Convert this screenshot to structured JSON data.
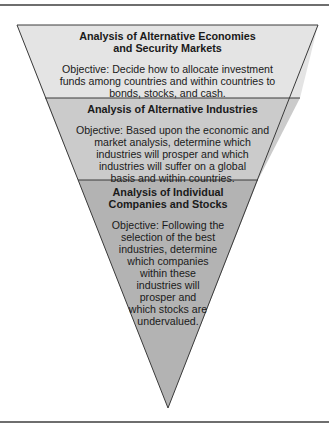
{
  "diagram": {
    "type": "inverted-funnel",
    "colors": {
      "level1_fill": "#e4e4e4",
      "level2_fill": "#cbcbcb",
      "level3_fill": "#b3b3b3",
      "outline": "#3a3a3a",
      "rule": "#6e6e6e"
    },
    "levels": [
      {
        "title_line1": "Analysis of Alternative Economies",
        "title_line2": "and Security Markets",
        "objective_lines": [
          "Objective: Decide how to allocate investment",
          "funds among countries and within countries to",
          "bonds, stocks, and cash."
        ]
      },
      {
        "title_line1": "Analysis of Alternative Industries",
        "objective_lines": [
          "Objective: Based upon the economic and",
          "market analysis, determine which",
          "industries will prosper and which",
          "industries will suffer on a global",
          "basis and within countries."
        ]
      },
      {
        "title_line1": "Analysis of Individual",
        "title_line2": "Companies and Stocks",
        "objective_lines": [
          "Objective: Following the",
          "selection of the best",
          "industries, determine",
          "which companies",
          "within these",
          "industries will",
          "prosper and",
          "which stocks are",
          "undervalued."
        ]
      }
    ]
  }
}
